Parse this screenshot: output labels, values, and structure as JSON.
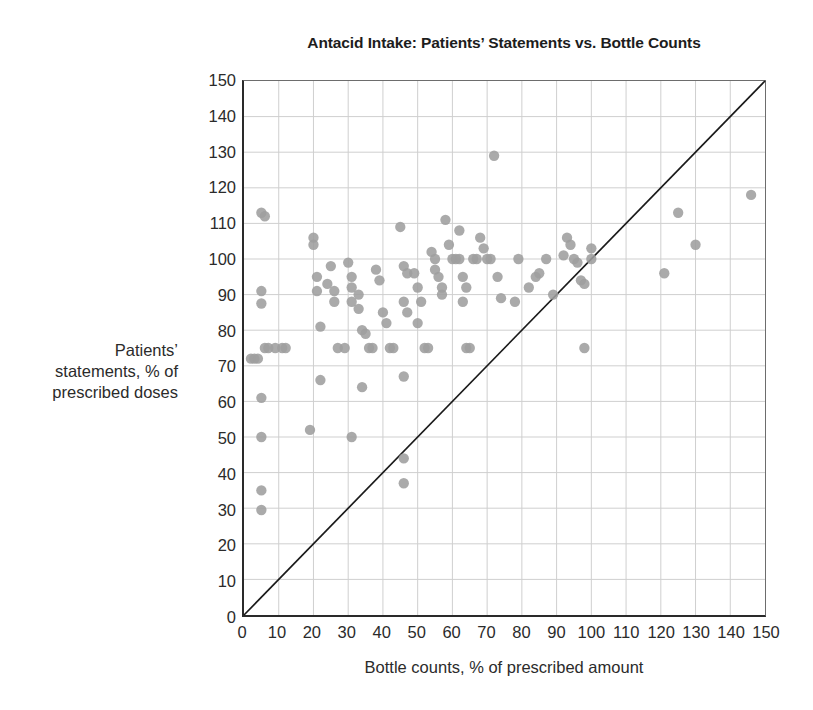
{
  "chart_data": {
    "type": "scatter",
    "title": "Antacid Intake: Patients’ Statements vs. Bottle Counts",
    "xlabel": "Bottle counts, % of prescribed amount",
    "ylabel_lines": [
      "Patients’",
      "statements, % of",
      "prescribed doses"
    ],
    "ylabel": "Patients’ statements, % of prescribed doses",
    "xlim": [
      0,
      150
    ],
    "ylim": [
      0,
      150
    ],
    "xticks": [
      0,
      10,
      20,
      30,
      40,
      50,
      60,
      70,
      80,
      90,
      100,
      110,
      120,
      130,
      140,
      150
    ],
    "yticks": [
      0,
      10,
      20,
      30,
      40,
      50,
      60,
      70,
      80,
      90,
      100,
      110,
      120,
      130,
      140,
      150
    ],
    "grid": true,
    "legend": "none",
    "colors": {
      "point": "#9e9e9e",
      "grid": "#cfcfcf",
      "axis": "#2a2a2a",
      "reference_line": "#1a1a1a",
      "background": "#ffffff"
    },
    "point_radius": 5.2,
    "annotations": [
      {
        "kind": "reference_line",
        "label": "line of identity (y = x)",
        "from": [
          0,
          0
        ],
        "to": [
          150,
          150
        ]
      }
    ],
    "series": [
      {
        "name": "Patients",
        "marker": "circle",
        "points": [
          [
            2,
            72
          ],
          [
            3,
            72
          ],
          [
            4,
            72
          ],
          [
            5,
            113
          ],
          [
            6,
            112
          ],
          [
            5,
            91
          ],
          [
            5,
            87.5
          ],
          [
            5,
            61
          ],
          [
            5,
            50
          ],
          [
            5,
            35
          ],
          [
            5,
            29.5
          ],
          [
            6,
            75
          ],
          [
            7,
            75
          ],
          [
            9,
            75
          ],
          [
            11,
            75
          ],
          [
            12,
            75
          ],
          [
            19,
            52
          ],
          [
            20,
            106
          ],
          [
            20,
            104
          ],
          [
            21,
            95
          ],
          [
            21,
            91
          ],
          [
            22,
            81
          ],
          [
            22,
            66
          ],
          [
            24,
            93
          ],
          [
            25,
            98
          ],
          [
            26,
            91
          ],
          [
            26,
            88
          ],
          [
            27,
            75
          ],
          [
            29,
            75
          ],
          [
            30,
            99
          ],
          [
            31,
            95
          ],
          [
            31,
            92
          ],
          [
            31,
            88
          ],
          [
            31,
            50
          ],
          [
            33,
            90
          ],
          [
            33,
            86
          ],
          [
            34,
            80
          ],
          [
            35,
            79
          ],
          [
            34,
            64
          ],
          [
            36,
            75
          ],
          [
            37,
            75
          ],
          [
            38,
            97
          ],
          [
            39,
            94
          ],
          [
            40,
            85
          ],
          [
            41,
            82
          ],
          [
            42,
            75
          ],
          [
            43,
            75
          ],
          [
            45,
            109
          ],
          [
            46,
            98
          ],
          [
            47,
            96
          ],
          [
            46,
            88
          ],
          [
            47,
            85
          ],
          [
            46,
            67
          ],
          [
            46,
            44
          ],
          [
            46,
            37
          ],
          [
            49,
            96
          ],
          [
            50,
            92
          ],
          [
            50,
            82
          ],
          [
            51,
            88
          ],
          [
            52,
            75
          ],
          [
            53,
            75
          ],
          [
            54,
            102
          ],
          [
            55,
            100
          ],
          [
            55,
            97
          ],
          [
            56,
            95
          ],
          [
            57,
            92
          ],
          [
            57,
            90
          ],
          [
            58,
            111
          ],
          [
            59,
            104
          ],
          [
            60,
            100
          ],
          [
            61,
            100
          ],
          [
            62,
            100
          ],
          [
            62,
            108
          ],
          [
            63,
            95
          ],
          [
            64,
            92
          ],
          [
            63,
            88
          ],
          [
            64,
            75
          ],
          [
            65,
            75
          ],
          [
            66,
            100
          ],
          [
            67,
            100
          ],
          [
            68,
            106
          ],
          [
            69,
            103
          ],
          [
            70,
            100
          ],
          [
            71,
            100
          ],
          [
            72,
            129
          ],
          [
            73,
            95
          ],
          [
            74,
            89
          ],
          [
            78,
            88
          ],
          [
            79,
            100
          ],
          [
            82,
            92
          ],
          [
            84,
            95
          ],
          [
            85,
            96
          ],
          [
            87,
            100
          ],
          [
            89,
            90
          ],
          [
            92,
            101
          ],
          [
            93,
            106
          ],
          [
            94,
            104
          ],
          [
            95,
            100
          ],
          [
            96,
            99
          ],
          [
            97,
            94
          ],
          [
            98,
            93
          ],
          [
            98,
            75
          ],
          [
            100,
            103
          ],
          [
            100,
            100
          ],
          [
            121,
            96
          ],
          [
            125,
            113
          ],
          [
            130,
            104
          ],
          [
            146,
            118
          ]
        ]
      }
    ]
  }
}
